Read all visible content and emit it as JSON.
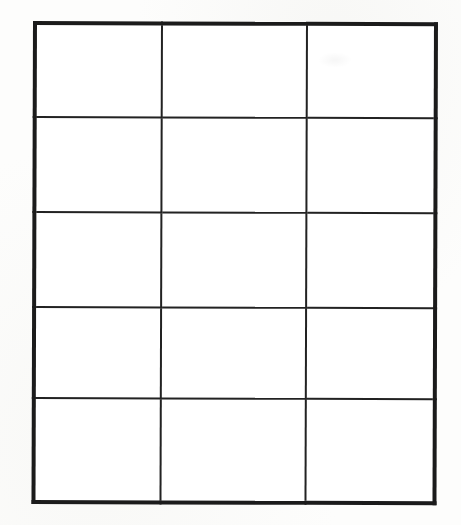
{
  "document": {
    "kind": "blank-table",
    "title": "",
    "background_color": "#fdfdfc",
    "paper_color": "#ffffff",
    "line_color": "#222222",
    "outer_border_color": "#1b1b1b",
    "outer_border_width_px": 4,
    "inner_line_width_px": 2
  },
  "table": {
    "rows": 5,
    "columns": 3,
    "has_header_row": false,
    "is_empty": true,
    "column_widths_px": [
      127,
      145,
      129
    ],
    "row_heights_px": [
      94,
      95,
      95,
      91,
      104
    ],
    "bounds_px": {
      "left": 33,
      "top": 21,
      "width": 401,
      "height": 479
    },
    "column_headers": [
      "",
      "",
      ""
    ],
    "cells": [
      [
        "",
        "",
        ""
      ],
      [
        "",
        "",
        ""
      ],
      [
        "",
        "",
        ""
      ],
      [
        "",
        "",
        ""
      ],
      [
        "",
        "",
        ""
      ]
    ]
  }
}
